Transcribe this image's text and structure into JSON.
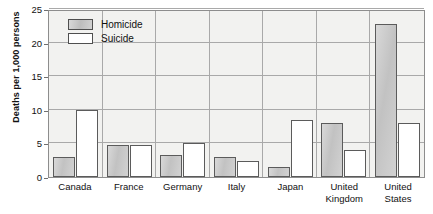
{
  "chart_data": {
    "type": "bar",
    "title": "",
    "xlabel": "",
    "ylabel": "Deaths per 1,000 persons",
    "ylim": [
      0,
      25
    ],
    "yticks": [
      0,
      5,
      10,
      15,
      20,
      25
    ],
    "grid": true,
    "legend_position": "top-left-inside",
    "categories": [
      "Canada",
      "France",
      "Germany",
      "Italy",
      "Japan",
      "United Kingdom",
      "United States"
    ],
    "series": [
      {
        "name": "Homicide",
        "color": "#c9c9c9",
        "values": [
          3.0,
          4.8,
          3.3,
          3.0,
          1.5,
          8.0,
          22.7
        ]
      },
      {
        "name": "Suicide",
        "color": "#ffffff",
        "values": [
          10.0,
          4.8,
          5.1,
          2.4,
          8.5,
          4.0,
          8.0
        ]
      }
    ]
  },
  "axis": {
    "y_title": "Deaths per 1,000 persons",
    "ticks": [
      "0",
      "5",
      "10",
      "15",
      "20",
      "25"
    ]
  },
  "legend": {
    "items": [
      {
        "label": "Homicide"
      },
      {
        "label": "Suicide"
      }
    ]
  },
  "categories": [
    {
      "line1": "Canada",
      "line2": ""
    },
    {
      "line1": "France",
      "line2": ""
    },
    {
      "line1": "Germany",
      "line2": ""
    },
    {
      "line1": "Italy",
      "line2": ""
    },
    {
      "line1": "Japan",
      "line2": ""
    },
    {
      "line1": "United",
      "line2": "Kingdom"
    },
    {
      "line1": "United",
      "line2": "States"
    }
  ]
}
